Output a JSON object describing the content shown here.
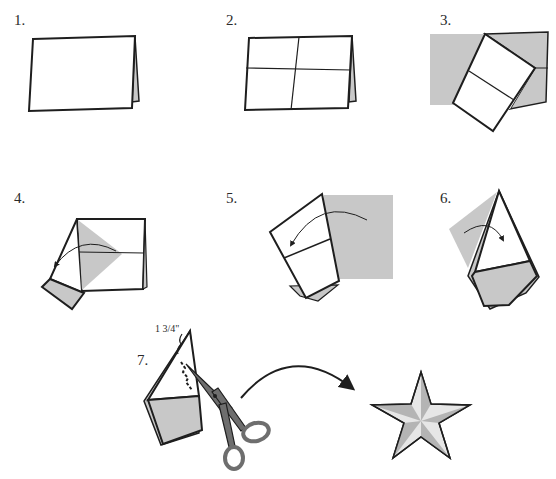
{
  "diagram": {
    "type": "instructional-folding-steps",
    "colors": {
      "paper": "#ffffff",
      "shade": "#c8c8c8",
      "outline": "#1e1e1e",
      "star_light": "#e6e6e6",
      "star_dark": "#b4b4b4"
    },
    "steps": [
      {
        "label": "1.",
        "description": "folded rectangle"
      },
      {
        "label": "2.",
        "description": "rectangle with center creases"
      },
      {
        "label": "3.",
        "description": "fold corner across"
      },
      {
        "label": "4.",
        "description": "fold left side over"
      },
      {
        "label": "5.",
        "description": "fold right side over"
      },
      {
        "label": "6.",
        "description": "fold back"
      },
      {
        "label": "7.",
        "description": "cut at angle",
        "measurement": "1 3/4\""
      }
    ],
    "result": "five-pointed star"
  }
}
